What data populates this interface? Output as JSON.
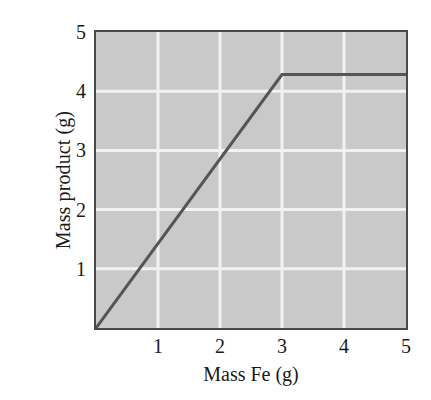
{
  "chart_data": {
    "type": "line",
    "title": "",
    "xlabel": "Mass Fe (g)",
    "ylabel": "Mass product (g)",
    "xlim": [
      0,
      5
    ],
    "ylim": [
      0,
      5
    ],
    "xticks": [
      "1",
      "2",
      "3",
      "4",
      "5"
    ],
    "xtick_values": [
      1,
      2,
      3,
      4,
      5
    ],
    "yticks": [
      "1",
      "2",
      "3",
      "4",
      "5"
    ],
    "ytick_values": [
      1,
      2,
      3,
      4,
      5
    ],
    "grid": true,
    "grid_color": "#f2f2f2",
    "plot_background": "#c9c9c9",
    "legend": null,
    "series": [
      {
        "name": "Mass product",
        "color": "#555555",
        "line_width": 3,
        "x": [
          0,
          3,
          5
        ],
        "y": [
          0,
          4.28,
          4.28
        ],
        "points": [
          {
            "x": 0,
            "y": 0
          },
          {
            "x": 3,
            "y": 4.28
          },
          {
            "x": 5,
            "y": 4.28
          }
        ],
        "description": "Linear rise from origin to the limiting point at x = 3, then a horizontal plateau at y = 4.28"
      }
    ]
  }
}
